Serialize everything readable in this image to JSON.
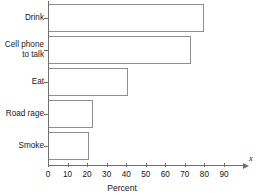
{
  "chart_data": {
    "type": "bar",
    "orientation": "horizontal",
    "title": "",
    "subtitle": "",
    "xlabel": "Percent",
    "ylabel": "",
    "axis_name_x": "x",
    "categories": [
      "Drink",
      "Cell phone\nto talk",
      "Eat",
      "Road rage",
      "Smoke"
    ],
    "values": [
      80,
      73,
      41,
      23,
      21
    ],
    "xlim": [
      0,
      95
    ],
    "xticks": [
      0,
      10,
      20,
      30,
      40,
      50,
      60,
      70,
      80,
      90
    ],
    "xtick_labels": [
      "0",
      "10",
      "20",
      "30",
      "40",
      "50",
      "60",
      "70",
      "80",
      "90"
    ],
    "grid": false,
    "legend": null,
    "bar_fill_color": "#ffffff",
    "bar_edge_color": "#8e8e8e",
    "axis_color": "#6f6f6f",
    "text_color": "#161616"
  }
}
